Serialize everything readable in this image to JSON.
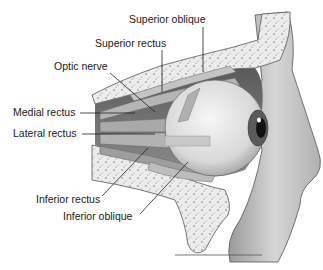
{
  "diagram": {
    "labels": [
      {
        "id": "superior-oblique",
        "text": "Superior oblique",
        "x": 129,
        "y": 13
      },
      {
        "id": "superior-rectus",
        "text": "Superior rectus",
        "x": 95,
        "y": 37
      },
      {
        "id": "optic-nerve",
        "text": "Optic nerve",
        "x": 54,
        "y": 60
      },
      {
        "id": "medial-rectus",
        "text": "Medial rectus",
        "x": 13,
        "y": 106
      },
      {
        "id": "lateral-rectus",
        "text": "Lateral rectus",
        "x": 13,
        "y": 127
      },
      {
        "id": "inferior-rectus",
        "text": "Inferior rectus",
        "x": 36,
        "y": 193
      },
      {
        "id": "inferior-oblique",
        "text": "Inferior oblique",
        "x": 63,
        "y": 210
      }
    ],
    "colors": {
      "bone": "#ececec",
      "bone_speckle": "#8a8a8a",
      "orbit_shadow": "#6e6e6e",
      "muscle": "#b8b8b8",
      "eyeball": "#e4e4e4",
      "iris": "#555555",
      "pupil": "#111111",
      "leader_line": "#222222",
      "skin": "#cfcfcf"
    }
  }
}
